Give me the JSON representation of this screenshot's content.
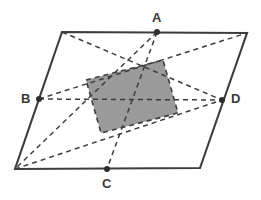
{
  "figure": {
    "canvas": {
      "width": 261,
      "height": 200
    },
    "colors": {
      "outline": "#3d3d3d",
      "dashed": "#3d3d3d",
      "shaded_fill": "#9a9a9a",
      "shaded_stroke": "#3d3d3d",
      "point_fill": "#2e2e2e",
      "label_text": "#3a3a3a",
      "background": "#ffffff"
    },
    "stroke_widths": {
      "outline": 2.1,
      "dashed": 1.5,
      "shaded_border": 1.5
    },
    "dash_pattern": "5,4"
  },
  "parallelogram": {
    "name": "outer-parallelogram",
    "vertices": [
      {
        "id": "P1",
        "x": 62,
        "y": 32
      },
      {
        "id": "P2",
        "x": 247,
        "y": 33
      },
      {
        "id": "P3",
        "x": 200,
        "y": 168
      },
      {
        "id": "P4",
        "x": 15,
        "y": 169
      }
    ]
  },
  "midpoints": [
    {
      "id": "A",
      "label": "A",
      "x": 157,
      "y": 32,
      "label_x": 152,
      "label_y": 11,
      "on_side": "P1-P2"
    },
    {
      "id": "B",
      "label": "B",
      "x": 39,
      "y": 99,
      "label_x": 21,
      "label_y": 92,
      "on_side": "P4-P1"
    },
    {
      "id": "C",
      "label": "C",
      "x": 107,
      "y": 169,
      "label_x": 102,
      "label_y": 177,
      "on_side": "P3-P4"
    },
    {
      "id": "D",
      "label": "D",
      "x": 222,
      "y": 100,
      "label_x": 231,
      "label_y": 92,
      "on_side": "P2-P3"
    }
  ],
  "dashed_lines": [
    {
      "id": "line-P1-D",
      "from": "P1",
      "to": "D",
      "x1": 62,
      "y1": 32,
      "x2": 222,
      "y2": 100
    },
    {
      "id": "line-B-P2",
      "from": "B",
      "to": "P2",
      "x1": 39,
      "y1": 99,
      "x2": 247,
      "y2": 33
    },
    {
      "id": "line-A-P4",
      "from": "A",
      "to": "P4",
      "x1": 157,
      "y1": 32,
      "x2": 15,
      "y2": 169
    },
    {
      "id": "line-P4-D",
      "from": "P4",
      "to": "D",
      "x1": 15,
      "y1": 169,
      "x2": 222,
      "y2": 100
    },
    {
      "id": "line-A-C",
      "from": "A",
      "to": "C",
      "x1": 157,
      "y1": 32,
      "x2": 107,
      "y2": 169
    },
    {
      "id": "line-B-D",
      "from": "B",
      "to": "D",
      "x1": 39,
      "y1": 99,
      "x2": 222,
      "y2": 100
    }
  ],
  "shaded_region": {
    "name": "shaded-inner-quadrilateral",
    "points": [
      {
        "x": 86,
        "y": 80
      },
      {
        "x": 163,
        "y": 60
      },
      {
        "x": 178,
        "y": 113
      },
      {
        "x": 101,
        "y": 133
      }
    ],
    "polygon": "86,80 163,60 178,113 101,133"
  },
  "point_radius": 3.0
}
